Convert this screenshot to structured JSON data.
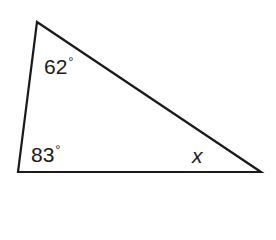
{
  "diagram": {
    "type": "triangle",
    "vertices": {
      "top": [
        37,
        22
      ],
      "bottom_left": [
        18,
        172
      ],
      "bottom_right": [
        261,
        172
      ]
    },
    "stroke_color": "#1a1a1a",
    "angles": [
      {
        "vertex": "top",
        "value": "62",
        "unit": "°"
      },
      {
        "vertex": "bottom_left",
        "value": "83",
        "unit": "°"
      },
      {
        "vertex": "bottom_right",
        "value": "x",
        "unit": ""
      }
    ]
  }
}
